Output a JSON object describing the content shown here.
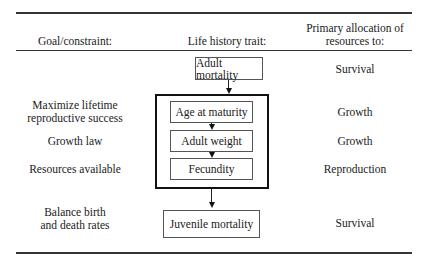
{
  "headers": {
    "goal": "Goal/constraint:",
    "trait": "Life history trait:",
    "allocation_line1": "Primary allocation of",
    "allocation_line2": "resources to:"
  },
  "rows": {
    "adult_mortality": {
      "trait": "Adult mortality",
      "allocation": "Survival"
    },
    "age_at_maturity": {
      "goal_line1": "Maximize lifetime",
      "goal_line2": "reproductive success",
      "trait": "Age at maturity",
      "allocation": "Growth"
    },
    "adult_weight": {
      "goal": "Growth law",
      "trait": "Adult weight",
      "allocation": "Growth"
    },
    "fecundity": {
      "goal": "Resources available",
      "trait": "Fecundity",
      "allocation": "Reproduction"
    },
    "juvenile_mortality": {
      "goal_line1": "Balance birth",
      "goal_line2": "and death rates",
      "trait": "Juvenile mortality",
      "allocation": "Survival"
    }
  }
}
